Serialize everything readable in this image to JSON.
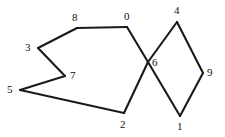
{
  "figure": {
    "background_color": "#ffffff",
    "edge_color": "#1a1a1a",
    "label_color": "#111111",
    "width": 225,
    "height": 137
  },
  "chart_data": {
    "type": "diagram",
    "subtype": "node-link-graph",
    "title": "",
    "xlabel": "",
    "ylabel": "",
    "grid": false,
    "legend": null,
    "xlim": [
      0,
      225
    ],
    "ylim": [
      0,
      137
    ],
    "node_labels": [
      "0",
      "1",
      "2",
      "3",
      "4",
      "5",
      "6",
      "7",
      "8",
      "9"
    ],
    "nodes": [
      {
        "id": "0",
        "label": "0",
        "x": 127,
        "y": 27,
        "label_x": 124,
        "label_y": 11
      },
      {
        "id": "1",
        "label": "1",
        "x": 180,
        "y": 116,
        "label_x": 177,
        "label_y": 121
      },
      {
        "id": "2",
        "label": "2",
        "x": 124,
        "y": 113,
        "label_x": 120,
        "label_y": 119
      },
      {
        "id": "3",
        "label": "3",
        "x": 38,
        "y": 48,
        "label_x": 25,
        "label_y": 42
      },
      {
        "id": "4",
        "label": "4",
        "x": 177,
        "y": 22,
        "label_x": 174,
        "label_y": 5
      },
      {
        "id": "5",
        "label": "5",
        "x": 20,
        "y": 90,
        "label_x": 7,
        "label_y": 84
      },
      {
        "id": "6",
        "label": "6",
        "x": 148,
        "y": 62,
        "label_x": 152,
        "label_y": 57
      },
      {
        "id": "7",
        "label": "7",
        "x": 65,
        "y": 76,
        "label_x": 70,
        "label_y": 70
      },
      {
        "id": "8",
        "label": "8",
        "x": 77,
        "y": 28,
        "label_x": 72,
        "label_y": 12
      },
      {
        "id": "9",
        "label": "9",
        "x": 203,
        "y": 73,
        "label_x": 207,
        "label_y": 67
      }
    ],
    "edges": [
      {
        "source": "0",
        "target": "8"
      },
      {
        "source": "8",
        "target": "3"
      },
      {
        "source": "3",
        "target": "7"
      },
      {
        "source": "7",
        "target": "5"
      },
      {
        "source": "5",
        "target": "2"
      },
      {
        "source": "2",
        "target": "6"
      },
      {
        "source": "6",
        "target": "4"
      },
      {
        "source": "4",
        "target": "9"
      },
      {
        "source": "9",
        "target": "1"
      },
      {
        "source": "1",
        "target": "6"
      },
      {
        "source": "6",
        "target": "0"
      }
    ]
  }
}
